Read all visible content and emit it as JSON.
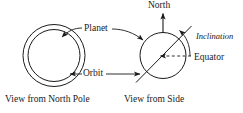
{
  "figure": {
    "type": "schematic-diagram",
    "background_color": "#ffffff",
    "stroke_color": "#1a1a1a",
    "width": 243,
    "height": 113
  },
  "labels": {
    "planet": "Planet",
    "orbit": "Orbit",
    "north": "North",
    "inclination": "Inclination",
    "equator": "Equator"
  },
  "captions": {
    "left": "View from North Pole",
    "right": "View from Side"
  },
  "panels": {
    "left": {
      "name": "view-from-north-pole",
      "outer_circle": {
        "cx": 54,
        "cy": 55.5,
        "r": 31,
        "meaning": "orbit"
      },
      "inner_circle": {
        "cx": 54,
        "cy": 55.5,
        "r": 26,
        "meaning": "planet"
      }
    },
    "right": {
      "name": "view-from-side",
      "planet_circle": {
        "cx": 163,
        "cy": 55.5,
        "r": 23
      },
      "rotation_axis": {
        "x1": 136,
        "y1": 82,
        "x2": 191,
        "y2": 26,
        "tilt_deg": 45
      },
      "north_arrow": {
        "x": 163,
        "y_from": 33,
        "y_to": 14,
        "direction": "up"
      },
      "equator_line": {
        "style": "dashed",
        "x1": 159,
        "y1": 56,
        "x2": 190,
        "y2": 56
      },
      "inclination_arc": {
        "from": "vertical-north",
        "to": "tilted-axis",
        "arrowhead": "at-axis"
      }
    }
  }
}
